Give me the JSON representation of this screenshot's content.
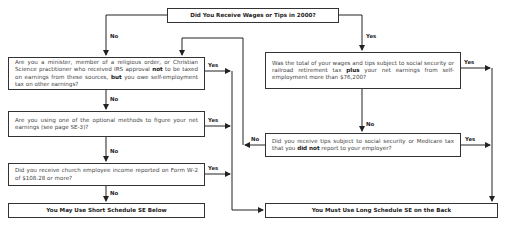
{
  "flowchart": {
    "start": {
      "text": "Did You Receive Wages or Tips in 2000?"
    },
    "left": {
      "q1": {
        "pre": "Are you a minister, member of a religious order, or Christian Science practitioner who received IRS approval ",
        "b1": "not",
        "mid": " to be taxed on earnings from these sources, ",
        "b2": "but",
        "post": " you owe self-employment tax on other earnings?"
      },
      "q2": {
        "text": "Are you using one of the optional methods to figure your net earnings (see page SE-3)?"
      },
      "q3": {
        "text": "Did you receive church employee income reported on Form W-2 of $108.28 or more?"
      },
      "result": {
        "text": "You May Use Short Schedule SE Below"
      }
    },
    "right": {
      "q1": {
        "pre": "Was the total of your wages and tips subject to social security or railroad retirement tax ",
        "b1": "plus",
        "post": " your net earnings from self-employment more than $76,200?"
      },
      "q2": {
        "pre": "Did you receive tips subject to social security or Medicare tax that you ",
        "b1": "did not",
        "post": " report to your employer?"
      },
      "result": {
        "text": "You Must Use Long Schedule SE on the Back"
      }
    },
    "labels": {
      "yes": "Yes",
      "no": "No"
    }
  }
}
